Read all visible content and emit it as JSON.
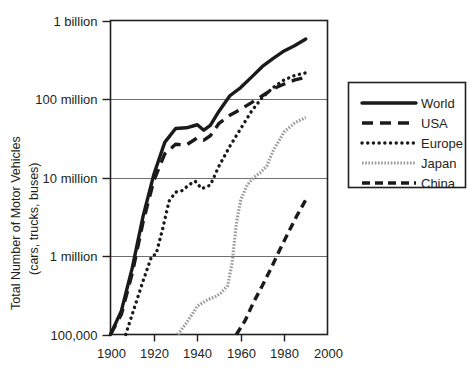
{
  "chart_data": {
    "type": "line",
    "title": "",
    "subtitle": "",
    "xlabel": "",
    "ylabel": "Total Number of Motor Vehicles (cars, trucks, buses)",
    "ylabel_line1": "Total Number of Motor Vehicles",
    "ylabel_line2": "(cars, trucks, buses)",
    "yscale": "log",
    "xlim": [
      1900,
      2000
    ],
    "ylim": [
      100000,
      1000000000
    ],
    "grid": true,
    "grid_axis": "y",
    "legend_position": "right-outside",
    "xticks": [
      1900,
      1920,
      1940,
      1960,
      1980,
      2000
    ],
    "xtick_labels": [
      "1900",
      "1920",
      "1940",
      "1960",
      "1980",
      "2000"
    ],
    "yticks": [
      100000,
      1000000,
      10000000,
      100000000,
      1000000000
    ],
    "ytick_labels": [
      "100,000",
      "1 million",
      "10 million",
      "100 million",
      "1 billion"
    ],
    "series": [
      {
        "name": "World",
        "style": "solid",
        "color": "#1a1a1a",
        "points": [
          [
            1900,
            100000
          ],
          [
            1905,
            200000
          ],
          [
            1910,
            700000
          ],
          [
            1915,
            3200000
          ],
          [
            1920,
            11000000
          ],
          [
            1925,
            28000000
          ],
          [
            1930,
            42000000
          ],
          [
            1935,
            43000000
          ],
          [
            1940,
            47000000
          ],
          [
            1943,
            40000000
          ],
          [
            1946,
            46000000
          ],
          [
            1950,
            70000000
          ],
          [
            1955,
            110000000
          ],
          [
            1960,
            140000000
          ],
          [
            1965,
            190000000
          ],
          [
            1970,
            260000000
          ],
          [
            1975,
            330000000
          ],
          [
            1980,
            410000000
          ],
          [
            1985,
            480000000
          ],
          [
            1990,
            580000000
          ]
        ]
      },
      {
        "name": "USA",
        "style": "dashed-long",
        "color": "#1a1a1a",
        "points": [
          [
            1900,
            100000
          ],
          [
            1905,
            180000
          ],
          [
            1910,
            600000
          ],
          [
            1915,
            2700000
          ],
          [
            1920,
            9200000
          ],
          [
            1925,
            20000000
          ],
          [
            1930,
            26500000
          ],
          [
            1935,
            26000000
          ],
          [
            1940,
            32000000
          ],
          [
            1943,
            30000000
          ],
          [
            1946,
            34000000
          ],
          [
            1950,
            49000000
          ],
          [
            1955,
            62000000
          ],
          [
            1960,
            74000000
          ],
          [
            1965,
            90000000
          ],
          [
            1970,
            110000000
          ],
          [
            1975,
            135000000
          ],
          [
            1980,
            155000000
          ],
          [
            1985,
            175000000
          ],
          [
            1990,
            190000000
          ]
        ]
      },
      {
        "name": "Europe",
        "style": "dotted",
        "color": "#1a1a1a",
        "points": [
          [
            1907,
            100000
          ],
          [
            1910,
            180000
          ],
          [
            1915,
            480000
          ],
          [
            1919,
            1000000
          ],
          [
            1921,
            1050000
          ],
          [
            1924,
            2200000
          ],
          [
            1927,
            5000000
          ],
          [
            1930,
            6500000
          ],
          [
            1933,
            6800000
          ],
          [
            1936,
            8000000
          ],
          [
            1939,
            9000000
          ],
          [
            1942,
            7200000
          ],
          [
            1946,
            8000000
          ],
          [
            1950,
            14000000
          ],
          [
            1955,
            25000000
          ],
          [
            1960,
            42000000
          ],
          [
            1965,
            70000000
          ],
          [
            1970,
            105000000
          ],
          [
            1975,
            140000000
          ],
          [
            1980,
            175000000
          ],
          [
            1985,
            200000000
          ],
          [
            1990,
            215000000
          ]
        ]
      },
      {
        "name": "Japan",
        "style": "fine-hatch",
        "color": "#9a9a9a",
        "points": [
          [
            1931,
            100000
          ],
          [
            1935,
            140000
          ],
          [
            1940,
            230000
          ],
          [
            1945,
            280000
          ],
          [
            1948,
            300000
          ],
          [
            1951,
            340000
          ],
          [
            1954,
            420000
          ],
          [
            1956,
            800000
          ],
          [
            1958,
            2600000
          ],
          [
            1960,
            5200000
          ],
          [
            1963,
            8000000
          ],
          [
            1966,
            10000000
          ],
          [
            1969,
            11500000
          ],
          [
            1972,
            14000000
          ],
          [
            1975,
            22000000
          ],
          [
            1980,
            38000000
          ],
          [
            1985,
            50000000
          ],
          [
            1990,
            58000000
          ]
        ]
      },
      {
        "name": "China",
        "style": "dashed-medium",
        "color": "#1a1a1a",
        "points": [
          [
            1958,
            100000
          ],
          [
            1962,
            150000
          ],
          [
            1966,
            260000
          ],
          [
            1970,
            420000
          ],
          [
            1974,
            700000
          ],
          [
            1978,
            1200000
          ],
          [
            1982,
            2000000
          ],
          [
            1986,
            3300000
          ],
          [
            1990,
            5200000
          ]
        ]
      }
    ]
  },
  "legend": {
    "items": [
      {
        "label": "World",
        "style": "solid",
        "color": "#1a1a1a"
      },
      {
        "label": "USA",
        "style": "dashed-long",
        "color": "#1a1a1a"
      },
      {
        "label": "Europe",
        "style": "dotted",
        "color": "#1a1a1a"
      },
      {
        "label": "Japan",
        "style": "fine-hatch",
        "color": "#9a9a9a"
      },
      {
        "label": "China",
        "style": "dashed-medium",
        "color": "#1a1a1a"
      }
    ]
  },
  "colors": {
    "frame": "#231f20",
    "grid": "#6e6e6e",
    "background": "#ffffff",
    "series_dark": "#1a1a1a",
    "series_gray": "#9a9a9a"
  }
}
